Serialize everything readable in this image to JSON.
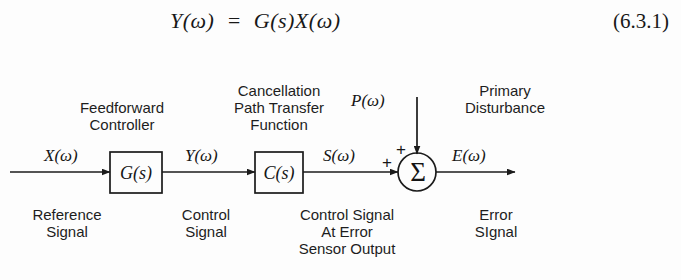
{
  "equation": {
    "expression": "Y(ω)  =  G(s)X(ω)",
    "number": "(6.3.1)"
  },
  "diagram": {
    "blocks": [
      {
        "id": "feedforward-controller",
        "block_label": "G(s)",
        "title": "Feedforward\nController",
        "caption": null
      },
      {
        "id": "cancellation-path",
        "block_label": "C(s)",
        "title": "Cancellation\nPath Transfer\nFunction",
        "caption": null
      }
    ],
    "summing_junction": {
      "symbol": "Σ",
      "sign_left": "+",
      "sign_top": "+"
    },
    "signals": {
      "input": "X(ω)",
      "controller_output": "Y(ω)",
      "cancellation_output": "S(ω)",
      "disturbance": "P(ω)",
      "error": "E(ω)"
    },
    "captions": {
      "reference": "Reference\nSignal",
      "control": "Control\nSignal",
      "control_at_error_sensor": "Control Signal\nAt Error\nSensor Output",
      "error": "Error\nSIgnal",
      "primary_disturbance": "Primary\nDisturbance"
    },
    "colors": {
      "ink": "#1b1b1b",
      "background": "#fdfdfd"
    }
  }
}
